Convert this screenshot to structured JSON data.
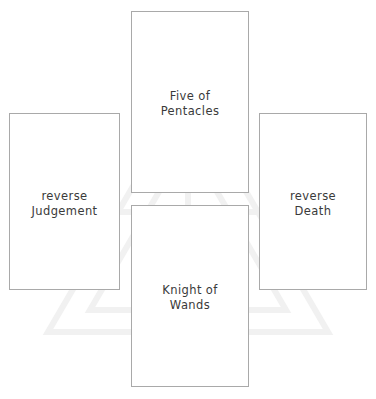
{
  "spread": {
    "background_color": "#ffffff",
    "card_border_color": "#a9a9a9",
    "card_face_color": "#ffffff",
    "text_color": "#3a3a3a",
    "cards": [
      {
        "position": "north",
        "label": "Five of\nPentacles",
        "name": "Five of Pentacles",
        "orientation": "upright"
      },
      {
        "position": "south",
        "label": "Knight of\nWands",
        "name": "Knight of Wands",
        "orientation": "upright"
      },
      {
        "position": "west",
        "label": "reverse\nJudgement",
        "name": "Judgement",
        "orientation": "reverse"
      },
      {
        "position": "east",
        "label": "reverse\nDeath",
        "name": "Death",
        "orientation": "reverse"
      }
    ]
  }
}
